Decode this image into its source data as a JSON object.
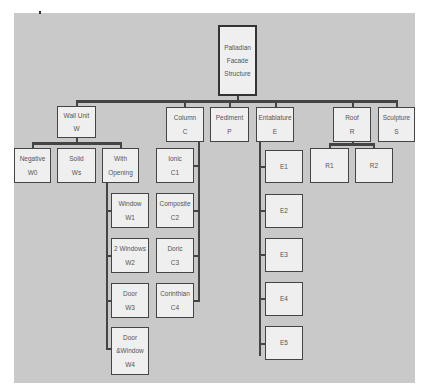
{
  "diagram": {
    "title": "Palladian Facade Structure",
    "root": {
      "lines": [
        "Palladian",
        "Facade",
        "Structure"
      ]
    },
    "level1": [
      {
        "label": "Wall Unit",
        "code": "W"
      },
      {
        "label": "Column",
        "code": "C"
      },
      {
        "label": "Pediment",
        "code": "P"
      },
      {
        "label": "Entablature",
        "code": "E"
      },
      {
        "label": "Roof",
        "code": "R"
      },
      {
        "label": "Sculpture",
        "code": "S"
      }
    ],
    "wall_unit_children": [
      {
        "label": "Negative",
        "code": "W0"
      },
      {
        "label": "Solid",
        "code": "Ws"
      },
      {
        "label": "With",
        "code": "Opening"
      }
    ],
    "with_opening_children": [
      {
        "label": "Window",
        "code": "W1"
      },
      {
        "label": "2 Windows",
        "code": "W2"
      },
      {
        "label": "Door",
        "code": "W3"
      },
      {
        "label": "Door",
        "label2": "&Window",
        "code": "W4"
      }
    ],
    "column_children": [
      {
        "label": "Ionic",
        "code": "C1"
      },
      {
        "label": "Composite",
        "code": "C2"
      },
      {
        "label": "Doric",
        "code": "C3"
      },
      {
        "label": "Corinthian",
        "code": "C4"
      }
    ],
    "entablature_children": [
      {
        "code": "E1"
      },
      {
        "code": "E2"
      },
      {
        "code": "E3"
      },
      {
        "code": "E4"
      },
      {
        "code": "E5"
      }
    ],
    "roof_children": [
      {
        "code": "R1"
      },
      {
        "code": "R2"
      }
    ]
  }
}
